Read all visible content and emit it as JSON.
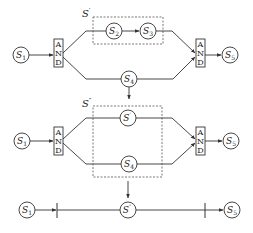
{
  "diagram": {
    "stages": [
      {
        "id": "stage1",
        "nodes": {
          "s1": {
            "base": "S",
            "sub": "1"
          },
          "s2": {
            "base": "S",
            "sub": "2"
          },
          "s3": {
            "base": "S",
            "sub": "3"
          },
          "s4": {
            "base": "S",
            "sub": "4"
          },
          "s5": {
            "base": "S",
            "sub": "5"
          }
        },
        "and_split": [
          "A",
          "N",
          "D"
        ],
        "and_join": [
          "A",
          "N",
          "D"
        ],
        "group_label": {
          "base": "S",
          "sup": "′"
        }
      },
      {
        "id": "stage2",
        "nodes": {
          "s1": {
            "base": "S",
            "sub": "1"
          },
          "sprime": {
            "base": "S",
            "sup": "′"
          },
          "s4": {
            "base": "S",
            "sub": "4"
          },
          "s5": {
            "base": "S",
            "sub": "5"
          }
        },
        "and_split": [
          "A",
          "N",
          "D"
        ],
        "and_join": [
          "A",
          "N",
          "D"
        ],
        "group_label": {
          "base": "S",
          "sup": "″"
        }
      },
      {
        "id": "stage3",
        "nodes": {
          "s1": {
            "base": "S",
            "sub": "1"
          },
          "sdprime": {
            "base": "S",
            "sup": "″"
          },
          "s5": {
            "base": "S",
            "sub": "5"
          }
        }
      }
    ],
    "colors": {
      "stroke": "#333333",
      "dashed": "#555555",
      "background": "#ffffff"
    }
  }
}
